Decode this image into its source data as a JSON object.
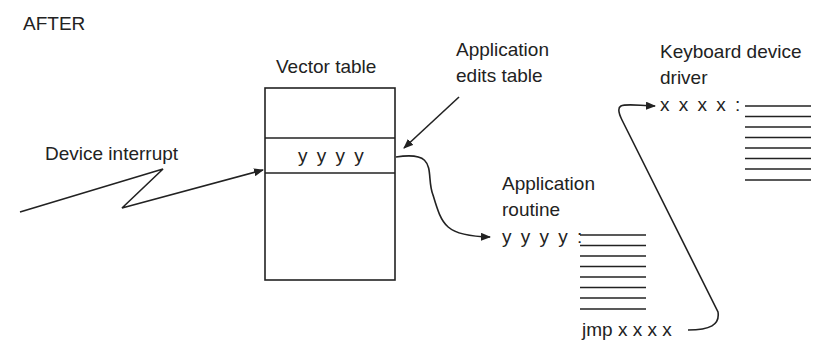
{
  "heading": "AFTER",
  "vector_table": {
    "label": "Vector table",
    "entry": "y y y y"
  },
  "device_interrupt": {
    "label": "Device interrupt"
  },
  "app_edits": {
    "line1": "Application",
    "line2": "edits table"
  },
  "app_routine": {
    "line1": "Application",
    "line2": "routine",
    "entry_label": "y y y y :",
    "code_line_count": 8,
    "exit_instruction": "jmp x x x x"
  },
  "keyboard_driver": {
    "line1": "Keyboard device",
    "line2": "driver",
    "entry_label": "x x x x :",
    "code_line_count": 8
  },
  "colors": {
    "ink": "#222222",
    "background": "#ffffff"
  }
}
